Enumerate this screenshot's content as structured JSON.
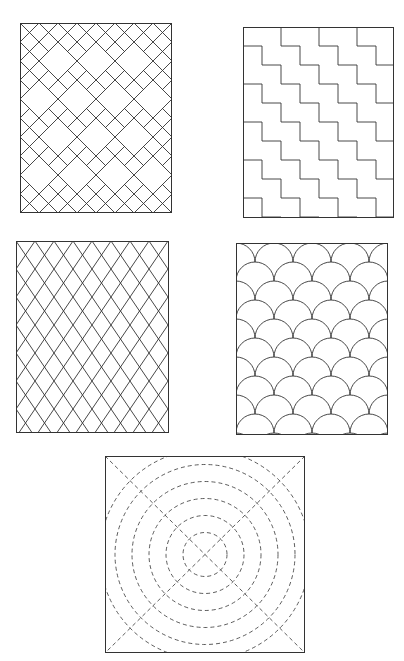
{
  "figure": {
    "background": "#ffffff",
    "stroke_color": "#333333",
    "panels": [
      {
        "id": "cross-diamond",
        "label": "Diagonal grid with cross/diamond motif",
        "x": 20,
        "y": 23,
        "w": 152,
        "h": 190
      },
      {
        "id": "zigzag-steps",
        "label": "Stepped zigzag stripes",
        "x": 243,
        "y": 27,
        "w": 151,
        "h": 191
      },
      {
        "id": "diagonal-lattice",
        "label": "Diagonal lattice (diamond grid)",
        "x": 16,
        "y": 241,
        "w": 153,
        "h": 192
      },
      {
        "id": "clamshell",
        "label": "Clamshell / scallop pattern",
        "x": 236,
        "y": 243,
        "w": 152,
        "h": 192
      },
      {
        "id": "concentric-circles",
        "label": "Concentric dashed circles with diagonals",
        "x": 105,
        "y": 456,
        "w": 200,
        "h": 197
      }
    ]
  }
}
